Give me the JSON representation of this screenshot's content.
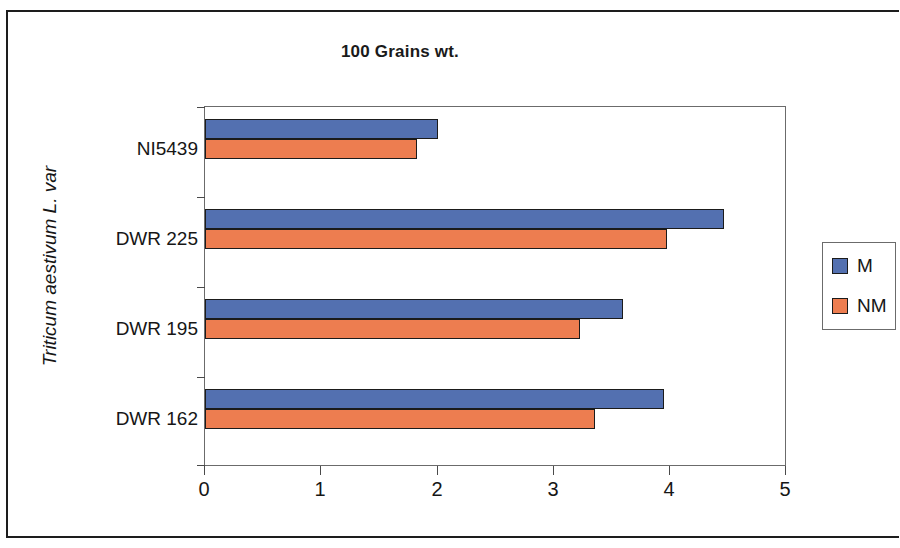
{
  "chart_data": {
    "type": "bar",
    "orientation": "horizontal",
    "title": "100 Grains wt.",
    "xlabel": "",
    "ylabel": "Triticum aestivum L. var",
    "categories": [
      "DWR 162",
      "DWR 195",
      "DWR 225",
      "NI5439"
    ],
    "series": [
      {
        "name": "M",
        "color": "#5370b0",
        "values": [
          3.96,
          3.6,
          4.47,
          2.01
        ]
      },
      {
        "name": "NM",
        "color": "#ed7d50",
        "values": [
          3.36,
          3.23,
          3.98,
          1.83
        ]
      }
    ],
    "xlim": [
      0,
      5
    ],
    "xticks": [
      "0",
      "1",
      "2",
      "3",
      "4",
      "5"
    ],
    "grid": false,
    "legend_position": "right"
  },
  "legend": {
    "entries": [
      {
        "label": "M",
        "color": "#5370b0"
      },
      {
        "label": "NM",
        "color": "#ed7d50"
      }
    ]
  },
  "axis": {
    "y_title": "Triticum aestivum L. var",
    "category_labels_top_to_bottom": [
      "NI5439",
      "DWR 225",
      "DWR 195",
      "DWR 162"
    ],
    "x_tick_labels": [
      "0",
      "1",
      "2",
      "3",
      "4",
      "5"
    ]
  },
  "colors": {
    "series_m": "#5370b0",
    "series_nm": "#ed7d50",
    "bar_outline": "#1b1b1b",
    "axis": "#6b6b6b",
    "text": "#161616",
    "frame": "#1d1d1d"
  }
}
